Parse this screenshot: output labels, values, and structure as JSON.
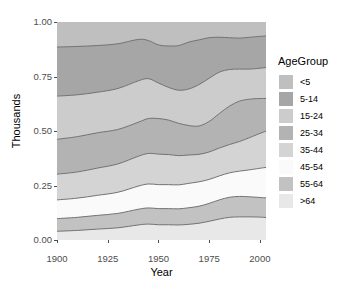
{
  "chart_data": {
    "type": "area",
    "title": "",
    "subtitle": "",
    "xlabel": "Year",
    "ylabel": "Thousands",
    "xlim": [
      1900,
      2003
    ],
    "ylim": [
      0,
      1
    ],
    "grid": true,
    "stacked": true,
    "normalized": true,
    "legend_position": "right",
    "legend_title": "AgeGroup",
    "x_ticks": [
      "1900",
      "1925",
      "1950",
      "1975",
      "2000"
    ],
    "x_tick_values": [
      1900,
      1925,
      1950,
      1975,
      2000
    ],
    "y_ticks": [
      "0.00",
      "0.25",
      "0.50",
      "0.75",
      "1.00"
    ],
    "y_tick_values": [
      0.0,
      0.25,
      0.5,
      0.75,
      1.0
    ],
    "x": [
      1900,
      1910,
      1920,
      1930,
      1940,
      1945,
      1950,
      1955,
      1960,
      1965,
      1970,
      1975,
      1980,
      1985,
      1990,
      1995,
      2000,
      2003
    ],
    "stack_order_bottom_to_top": [
      ">64",
      "55-64",
      "45-54",
      "35-44",
      "25-34",
      "15-24",
      "5-14",
      "<5"
    ],
    "series": [
      {
        "name": "<5",
        "color": "#bfbfbf",
        "cumulative_top": [
          1.0,
          1.0,
          1.0,
          1.0,
          1.0,
          1.0,
          1.0,
          1.0,
          1.0,
          1.0,
          1.0,
          1.0,
          1.0,
          1.0,
          1.0,
          1.0,
          1.0,
          1.0
        ],
        "values": [
          0.115,
          0.112,
          0.108,
          0.1,
          0.08,
          0.085,
          0.105,
          0.11,
          0.108,
          0.092,
          0.082,
          0.072,
          0.07,
          0.072,
          0.074,
          0.07,
          0.066,
          0.064
        ]
      },
      {
        "name": "5-14",
        "color": "#a6a6a6",
        "cumulative_top": [
          0.885,
          0.888,
          0.892,
          0.9,
          0.92,
          0.915,
          0.895,
          0.89,
          0.892,
          0.908,
          0.918,
          0.928,
          0.93,
          0.928,
          0.926,
          0.93,
          0.934,
          0.936
        ],
        "values": [
          0.225,
          0.222,
          0.214,
          0.205,
          0.19,
          0.175,
          0.175,
          0.19,
          0.205,
          0.215,
          0.205,
          0.186,
          0.16,
          0.146,
          0.142,
          0.146,
          0.146,
          0.145
        ]
      },
      {
        "name": "15-24",
        "color": "#cccccc",
        "cumulative_top": [
          0.66,
          0.666,
          0.678,
          0.695,
          0.73,
          0.74,
          0.72,
          0.7,
          0.687,
          0.693,
          0.713,
          0.742,
          0.77,
          0.782,
          0.784,
          0.784,
          0.788,
          0.791
        ],
        "values": [
          0.198,
          0.192,
          0.186,
          0.188,
          0.19,
          0.183,
          0.163,
          0.15,
          0.152,
          0.168,
          0.19,
          0.198,
          0.19,
          0.168,
          0.147,
          0.138,
          0.139,
          0.142
        ]
      },
      {
        "name": "25-34",
        "color": "#b3b3b3",
        "cumulative_top": [
          0.462,
          0.474,
          0.492,
          0.507,
          0.54,
          0.557,
          0.557,
          0.55,
          0.535,
          0.525,
          0.523,
          0.544,
          0.58,
          0.614,
          0.637,
          0.646,
          0.649,
          0.649
        ],
        "values": [
          0.16,
          0.162,
          0.162,
          0.158,
          0.156,
          0.16,
          0.163,
          0.158,
          0.148,
          0.135,
          0.13,
          0.14,
          0.158,
          0.176,
          0.185,
          0.176,
          0.16,
          0.15
        ]
      },
      {
        "name": "35-44",
        "color": "#d4d4d4",
        "cumulative_top": [
          0.302,
          0.312,
          0.33,
          0.349,
          0.384,
          0.397,
          0.394,
          0.392,
          0.387,
          0.39,
          0.393,
          0.404,
          0.422,
          0.438,
          0.452,
          0.47,
          0.489,
          0.499
        ],
        "values": [
          0.118,
          0.12,
          0.125,
          0.13,
          0.137,
          0.14,
          0.14,
          0.138,
          0.134,
          0.13,
          0.126,
          0.126,
          0.128,
          0.13,
          0.136,
          0.148,
          0.16,
          0.166
        ]
      },
      {
        "name": "45-54",
        "color": "#fafafa",
        "cumulative_top": [
          0.184,
          0.192,
          0.205,
          0.219,
          0.247,
          0.257,
          0.254,
          0.254,
          0.253,
          0.26,
          0.267,
          0.278,
          0.294,
          0.308,
          0.316,
          0.322,
          0.329,
          0.333
        ],
        "values": [
          0.086,
          0.088,
          0.092,
          0.097,
          0.106,
          0.11,
          0.11,
          0.11,
          0.11,
          0.112,
          0.112,
          0.11,
          0.11,
          0.112,
          0.116,
          0.124,
          0.134,
          0.14
        ]
      },
      {
        "name": "55-64",
        "color": "#c2c2c2",
        "cumulative_top": [
          0.098,
          0.104,
          0.113,
          0.122,
          0.141,
          0.147,
          0.144,
          0.144,
          0.143,
          0.148,
          0.155,
          0.168,
          0.184,
          0.196,
          0.2,
          0.198,
          0.195,
          0.193
        ],
        "values": [
          0.058,
          0.06,
          0.063,
          0.066,
          0.072,
          0.074,
          0.074,
          0.074,
          0.074,
          0.076,
          0.078,
          0.082,
          0.088,
          0.092,
          0.094,
          0.092,
          0.09,
          0.09
        ]
      },
      {
        "name": ">64",
        "color": "#e8e8e8",
        "cumulative_top": [
          0.04,
          0.044,
          0.05,
          0.056,
          0.069,
          0.073,
          0.07,
          0.07,
          0.069,
          0.072,
          0.077,
          0.086,
          0.096,
          0.104,
          0.106,
          0.106,
          0.105,
          0.103
        ],
        "values": [
          0.04,
          0.044,
          0.05,
          0.056,
          0.069,
          0.073,
          0.07,
          0.07,
          0.069,
          0.072,
          0.077,
          0.086,
          0.096,
          0.104,
          0.106,
          0.106,
          0.105,
          0.103
        ]
      }
    ]
  },
  "legend": {
    "title": "AgeGroup",
    "items": [
      {
        "label": "<5",
        "color": "#bfbfbf"
      },
      {
        "label": "5-14",
        "color": "#a6a6a6"
      },
      {
        "label": "15-24",
        "color": "#cccccc"
      },
      {
        "label": "25-34",
        "color": "#b3b3b3"
      },
      {
        "label": "35-44",
        "color": "#d4d4d4"
      },
      {
        "label": "45-54",
        "color": "#fafafa"
      },
      {
        "label": "55-64",
        "color": "#c2c2c2"
      },
      {
        "label": ">64",
        "color": "#e8e8e8"
      }
    ]
  },
  "axes": {
    "x_title": "Year",
    "y_title": "Thousands",
    "x_tick_labels": [
      "1900",
      "1925",
      "1950",
      "1975",
      "2000"
    ],
    "y_tick_labels": [
      "0.00",
      "0.25",
      "0.50",
      "0.75",
      "1.00"
    ]
  },
  "style": {
    "panel_background": "#d9d9d9",
    "gridline_color": "#ffffff",
    "line_color": "#737373",
    "tick_text_color": "#4d4d4d",
    "title_text_color": "#000000"
  }
}
